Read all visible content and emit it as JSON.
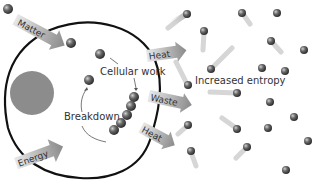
{
  "diagram": {
    "labels": {
      "matter": "Matter",
      "energy": "Energy",
      "heat_top": "Heat",
      "waste": "Waste",
      "heat_bottom": "Heat",
      "cellular_work": "Cellular work",
      "breakdown": "Breakdown",
      "increased_entropy": "Increased entropy"
    },
    "colors": {
      "background": "#ffffff",
      "cell_outline": "#111111",
      "nucleus": "#8c8c8c",
      "arrow": "#9a9a9a",
      "sphere": "#555555",
      "text": "#333333"
    }
  }
}
